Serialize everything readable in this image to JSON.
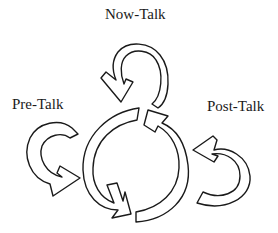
{
  "diagram": {
    "labels": {
      "now": "Now-Talk",
      "pre": "Pre-Talk",
      "post": "Post-Talk"
    },
    "elements": [
      {
        "id": "now-talk-loop",
        "shape": "curved-arrow",
        "direction": "counter-clockwise",
        "position": "top"
      },
      {
        "id": "pre-talk-loop",
        "shape": "curved-arrow",
        "direction": "counter-clockwise",
        "position": "left"
      },
      {
        "id": "post-talk-loop",
        "shape": "curved-arrow",
        "direction": "clockwise",
        "position": "right"
      },
      {
        "id": "central-cycle",
        "shape": "two-arc circular arrows",
        "direction": "cycle",
        "position": "center"
      }
    ],
    "colors": {
      "stroke": "#1a1a1a",
      "fill": "#ffffff",
      "background": "#ffffff"
    }
  }
}
